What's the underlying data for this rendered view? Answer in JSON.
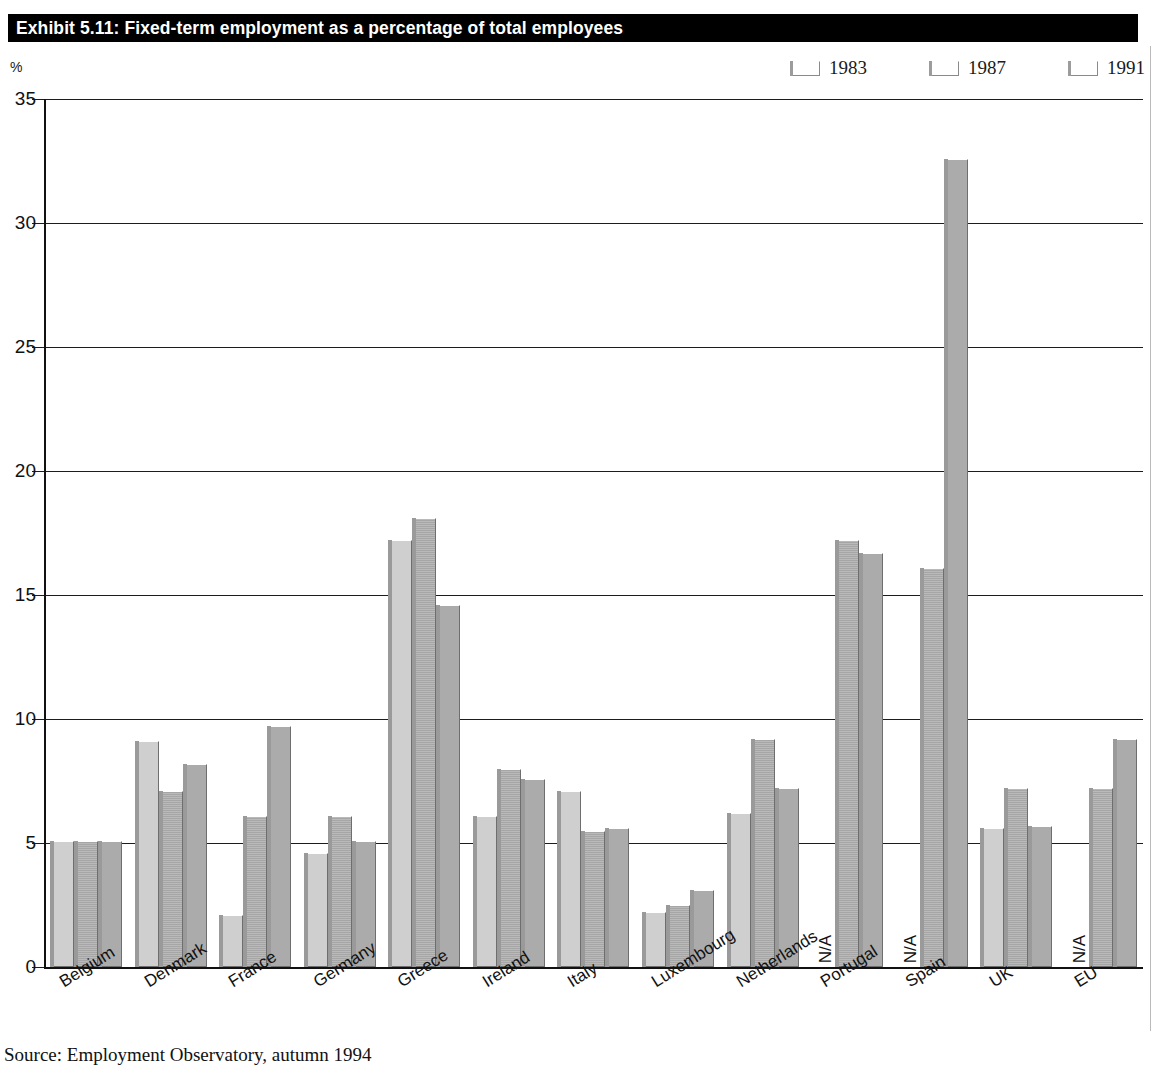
{
  "exhibit": {
    "title": "Exhibit 5.11: Fixed-term employment as a percentage of total employees",
    "source": "Source: Employment Observatory, autumn 1994"
  },
  "legend": {
    "items": [
      {
        "label": "1983",
        "color": "#cfcfcf"
      },
      {
        "label": "1987",
        "color": "#a6a6a6"
      },
      {
        "label": "1991",
        "color": "#ababab"
      }
    ]
  },
  "chart_data": {
    "type": "bar",
    "title": "Exhibit 5.11: Fixed-term employment as a percentage of total employees",
    "xlabel": "",
    "ylabel": "%",
    "ylim": [
      0,
      35
    ],
    "yticks": [
      0,
      5,
      10,
      15,
      20,
      25,
      30,
      35
    ],
    "ytick_labels": [
      "0",
      "5",
      "10",
      "15",
      "20",
      "25",
      "30",
      "35"
    ],
    "grid": true,
    "legend_position": "top-right",
    "na_text": "N/A",
    "categories": [
      "Belgium",
      "Denmark",
      "France",
      "Germany",
      "Greece",
      "Ireland",
      "Italy",
      "Luxembourg",
      "Netherlands",
      "Portugal",
      "Spain",
      "UK",
      "EU"
    ],
    "series": [
      {
        "name": "1983",
        "color": "#cfcfcf",
        "values": [
          5.1,
          9.1,
          2.1,
          4.6,
          17.2,
          6.1,
          7.1,
          2.2,
          6.2,
          null,
          null,
          5.6,
          null
        ]
      },
      {
        "name": "1987",
        "color": "#a6a6a6",
        "values": [
          5.1,
          7.1,
          6.1,
          6.1,
          18.1,
          8.0,
          5.5,
          2.5,
          9.2,
          17.2,
          16.1,
          7.2,
          7.2
        ]
      },
      {
        "name": "1991",
        "color": "#ababab",
        "values": [
          5.1,
          8.2,
          9.7,
          5.1,
          14.6,
          7.6,
          5.6,
          3.1,
          7.2,
          16.7,
          32.6,
          5.7,
          9.2
        ]
      }
    ]
  }
}
